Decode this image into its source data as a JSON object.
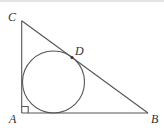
{
  "figure": {
    "type": "geometry",
    "vertices": {
      "A": {
        "label": "A",
        "x": 21.7,
        "y": 113
      },
      "B": {
        "label": "B",
        "x": 148,
        "y": 113
      },
      "C": {
        "label": "C",
        "x": 21.7,
        "y": 20.7
      }
    },
    "tangent_point": {
      "label": "D",
      "x": 72,
      "y": 57
    },
    "incircle": {
      "cx": 53.5,
      "cy": 82,
      "r": 31
    },
    "right_angle_at": "A",
    "colors": {
      "stroke": "#555555",
      "label": "#333333",
      "background": "#ffffff"
    }
  },
  "labels": {
    "A": "A",
    "B": "B",
    "C": "C",
    "D": "D"
  }
}
